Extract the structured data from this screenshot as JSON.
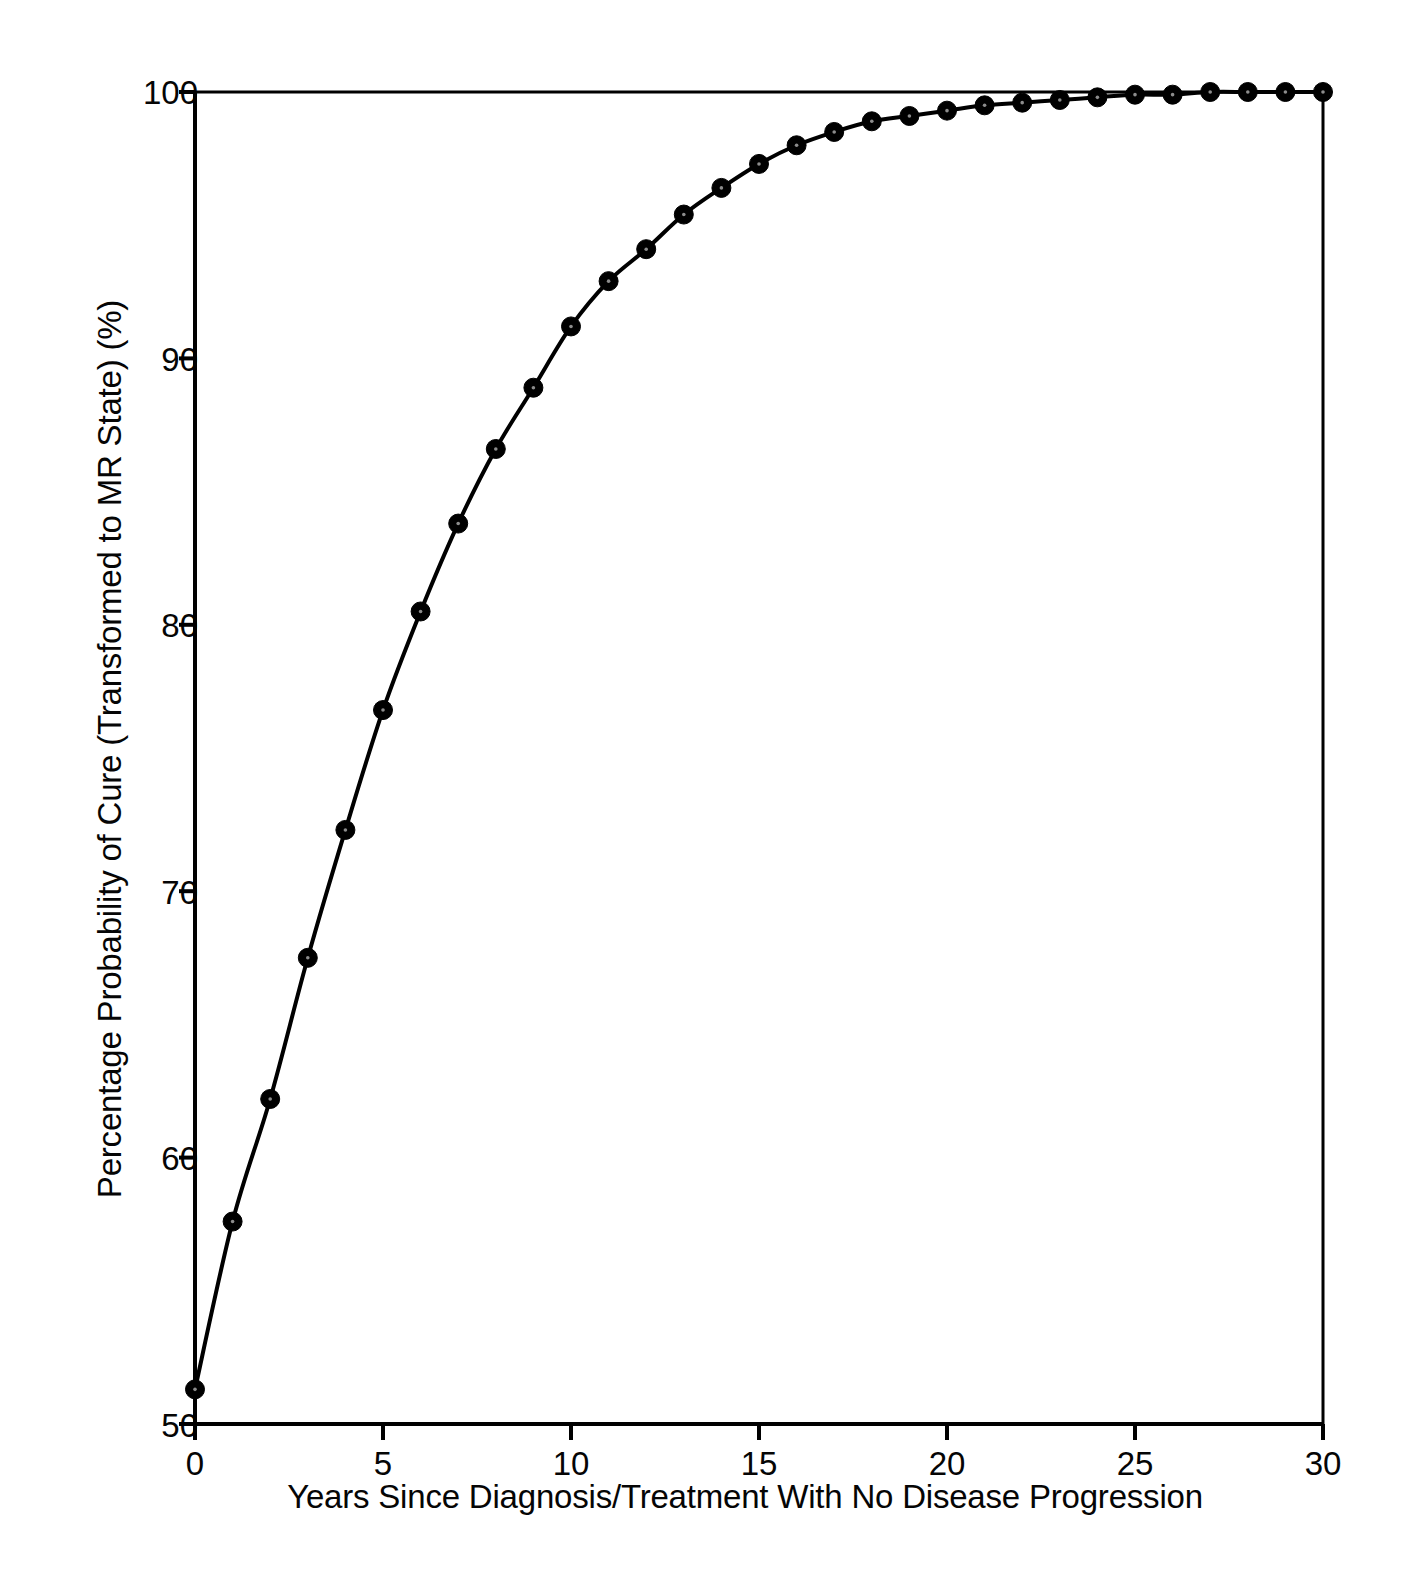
{
  "chart_data": {
    "type": "line",
    "title": "",
    "subtitle": "",
    "xlabel": "Years Since Diagnosis/Treatment With No Disease Progression",
    "ylabel": "Percentage Probability of Cure (Transformed to MR State) (%)",
    "xlim": [
      0,
      30
    ],
    "ylim": [
      50,
      100
    ],
    "xticks": [
      0,
      5,
      10,
      15,
      20,
      25,
      30
    ],
    "yticks": [
      50,
      60,
      70,
      80,
      90,
      100
    ],
    "xtick_labels": [
      "0",
      "5",
      "10",
      "15",
      "20",
      "25",
      "30"
    ],
    "ytick_labels": [
      "50",
      "60",
      "70",
      "80",
      "90",
      "100"
    ],
    "grid": false,
    "legend": null,
    "marker": "filled-circle",
    "line_color": "#000000",
    "marker_color": "#000000",
    "series": [
      {
        "name": "Percentage Probability of Cure",
        "x": [
          0,
          1,
          2,
          3,
          4,
          5,
          6,
          7,
          8,
          9,
          10,
          11,
          12,
          13,
          14,
          15,
          16,
          17,
          18,
          19,
          20,
          21,
          22,
          23,
          24,
          25,
          26,
          27,
          28,
          29,
          30
        ],
        "values": [
          51.3,
          57.6,
          62.2,
          67.5,
          72.3,
          76.8,
          80.5,
          83.8,
          86.6,
          88.9,
          91.2,
          92.9,
          94.1,
          95.4,
          96.4,
          97.3,
          98.0,
          98.5,
          98.9,
          99.1,
          99.3,
          99.5,
          99.6,
          99.7,
          99.8,
          99.9,
          99.9,
          100.0,
          100.0,
          100.0,
          100.0
        ]
      }
    ]
  },
  "axes": {
    "y_tick_labels": [
      "100",
      "90",
      "80",
      "70",
      "60",
      "50"
    ],
    "x_tick_labels": [
      "0",
      "5",
      "10",
      "15",
      "20",
      "25",
      "30"
    ]
  }
}
